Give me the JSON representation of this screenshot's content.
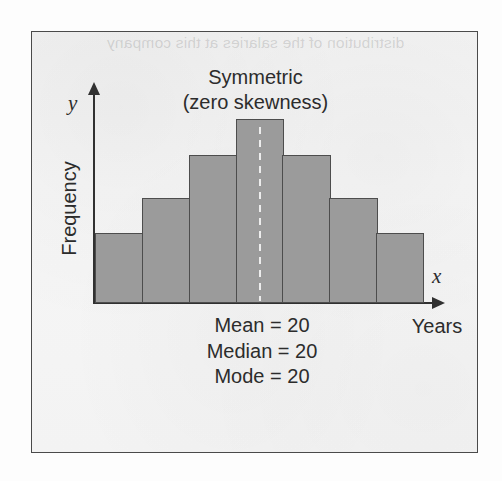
{
  "figure": {
    "ghost_text": "distribution of the salaries at this company",
    "frame_border_color": "#4a4a4a",
    "paper_color": "#f3f3f3"
  },
  "chart_data": {
    "type": "bar",
    "title": "Symmetric\n(zero skewness)",
    "title_line1": "Symmetric",
    "title_line2": "(zero skewness)",
    "xlabel": "Years",
    "ylabel": "Frequency",
    "x_axis_symbol": "x",
    "y_axis_symbol": "y",
    "categories": [
      "1",
      "2",
      "3",
      "4",
      "5",
      "6",
      "7"
    ],
    "values": [
      33,
      50,
      70,
      87,
      70,
      50,
      33
    ],
    "ylim": [
      0,
      100
    ],
    "grid": false,
    "legend": null,
    "bar_fill_color": "#9b9b9b",
    "bar_edge_color": "#4d4d4d",
    "annotations": [
      "Mean = 20",
      "Median = 20",
      "Mode = 20"
    ],
    "center_marker": {
      "label": "median-dashed-line",
      "at_category_index": 3,
      "color": "#ffffff",
      "style": "dashed"
    }
  },
  "stats": {
    "mean": "Mean = 20",
    "median": "Median = 20",
    "mode": "Mode = 20"
  }
}
